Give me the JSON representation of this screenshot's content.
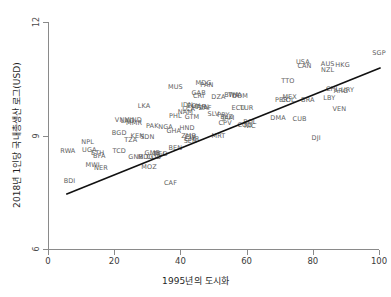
{
  "chart_data": {
    "type": "scatter",
    "title": "",
    "xlabel": "1995년의 도시화",
    "ylabel": "2018년 1인당 국내총생산 로그(USD)",
    "xlim": [
      0,
      100
    ],
    "ylim": [
      6,
      12
    ],
    "xticks": [
      0,
      20,
      40,
      60,
      80,
      100
    ],
    "yticks": [
      6,
      9,
      12
    ],
    "grid": false,
    "legend": "none",
    "marker_style": "text-labels",
    "label_color": "#5e5e5e",
    "trend_line": {
      "color": "#111111",
      "x_start": 5.5,
      "y_start": 7.45,
      "x_end": 100.5,
      "y_end": 10.79
    },
    "points": [
      {
        "label": "SGP",
        "x": 100.0,
        "y": 11.17
      },
      {
        "label": "HKG",
        "x": 89.0,
        "y": 10.87
      },
      {
        "label": "AUS",
        "x": 84.5,
        "y": 10.88
      },
      {
        "label": "USA",
        "x": 77.0,
        "y": 10.94
      },
      {
        "label": "CAN",
        "x": 77.5,
        "y": 10.84
      },
      {
        "label": "NZL",
        "x": 84.5,
        "y": 10.74
      },
      {
        "label": "TTO",
        "x": 72.5,
        "y": 10.44
      },
      {
        "label": "MDG",
        "x": 47.0,
        "y": 10.4
      },
      {
        "label": "PAN",
        "x": 48.0,
        "y": 10.34
      },
      {
        "label": "MUS",
        "x": 38.5,
        "y": 10.27
      },
      {
        "label": "CHL",
        "x": 86.0,
        "y": 10.24
      },
      {
        "label": "ARG",
        "x": 88.5,
        "y": 10.17
      },
      {
        "label": "URY",
        "x": 90.5,
        "y": 10.19
      },
      {
        "label": "GAB",
        "x": 45.5,
        "y": 10.13
      },
      {
        "label": "CRI",
        "x": 45.5,
        "y": 10.04
      },
      {
        "label": "DZA",
        "x": 51.5,
        "y": 10.03
      },
      {
        "label": "BWA",
        "x": 55.5,
        "y": 10.06
      },
      {
        "label": "THA",
        "x": 56.5,
        "y": 10.06
      },
      {
        "label": "DOM",
        "x": 58.0,
        "y": 10.04
      },
      {
        "label": "MEX",
        "x": 73.0,
        "y": 10.03
      },
      {
        "label": "LBY",
        "x": 85.0,
        "y": 9.99
      },
      {
        "label": "BRA",
        "x": 78.5,
        "y": 9.95
      },
      {
        "label": "COL",
        "x": 72.5,
        "y": 9.93
      },
      {
        "label": "PER",
        "x": 70.5,
        "y": 9.94
      },
      {
        "label": "LKA",
        "x": 29.0,
        "y": 9.78
      },
      {
        "label": "IDN",
        "x": 42.0,
        "y": 9.81
      },
      {
        "label": "EGY",
        "x": 44.0,
        "y": 9.78
      },
      {
        "label": "MAR",
        "x": 45.5,
        "y": 9.76
      },
      {
        "label": "TUN",
        "x": 46.5,
        "y": 9.76
      },
      {
        "label": "ZAF",
        "x": 47.5,
        "y": 9.74
      },
      {
        "label": "ECU",
        "x": 57.5,
        "y": 9.72
      },
      {
        "label": "TUR",
        "x": 60.0,
        "y": 9.72
      },
      {
        "label": "VEN",
        "x": 88.0,
        "y": 9.7
      },
      {
        "label": "LCA",
        "x": 42.5,
        "y": 9.7
      },
      {
        "label": "NAM",
        "x": 41.5,
        "y": 9.62
      },
      {
        "label": "SLV",
        "x": 50.0,
        "y": 9.56
      },
      {
        "label": "PRY",
        "x": 53.0,
        "y": 9.55
      },
      {
        "label": "GTM",
        "x": 43.5,
        "y": 9.48
      },
      {
        "label": "PHL",
        "x": 38.5,
        "y": 9.52
      },
      {
        "label": "BLZ",
        "x": 54.0,
        "y": 9.5
      },
      {
        "label": "JAM",
        "x": 54.5,
        "y": 9.46
      },
      {
        "label": "DMA",
        "x": 69.5,
        "y": 9.47
      },
      {
        "label": "CUB",
        "x": 76.0,
        "y": 9.44
      },
      {
        "label": "VNM",
        "x": 22.5,
        "y": 9.4
      },
      {
        "label": "LAO",
        "x": 24.0,
        "y": 9.38
      },
      {
        "label": "IND",
        "x": 26.5,
        "y": 9.4
      },
      {
        "label": "MMR",
        "x": 26.0,
        "y": 9.32
      },
      {
        "label": "BOL",
        "x": 61.0,
        "y": 9.35
      },
      {
        "label": "CPV",
        "x": 53.5,
        "y": 9.33
      },
      {
        "label": "COG",
        "x": 59.5,
        "y": 9.28
      },
      {
        "label": "NIC",
        "x": 61.0,
        "y": 9.24
      },
      {
        "label": "PAK",
        "x": 31.5,
        "y": 9.24
      },
      {
        "label": "NGA",
        "x": 35.5,
        "y": 9.22
      },
      {
        "label": "HND",
        "x": 42.0,
        "y": 9.2
      },
      {
        "label": "GHA",
        "x": 38.0,
        "y": 9.13
      },
      {
        "label": "BGD",
        "x": 21.5,
        "y": 9.06
      },
      {
        "label": "MRT",
        "x": 51.5,
        "y": 9.0
      },
      {
        "label": "ZMB",
        "x": 42.5,
        "y": 8.99
      },
      {
        "label": "CIV",
        "x": 43.0,
        "y": 8.97
      },
      {
        "label": "KEN",
        "x": 27.0,
        "y": 8.98
      },
      {
        "label": "CMR",
        "x": 43.5,
        "y": 8.9
      },
      {
        "label": "SEN",
        "x": 43.0,
        "y": 8.85
      },
      {
        "label": "SDN",
        "x": 30.0,
        "y": 8.96
      },
      {
        "label": "TZA",
        "x": 25.0,
        "y": 8.88
      },
      {
        "label": "NPL",
        "x": 12.0,
        "y": 8.82
      },
      {
        "label": "DJI",
        "x": 81.0,
        "y": 8.94
      },
      {
        "label": "BEN",
        "x": 38.5,
        "y": 8.66
      },
      {
        "label": "RWA",
        "x": 6.0,
        "y": 8.59
      },
      {
        "label": "UGA",
        "x": 12.5,
        "y": 8.61
      },
      {
        "label": "ETH",
        "x": 15.0,
        "y": 8.55
      },
      {
        "label": "TCD",
        "x": 21.5,
        "y": 8.6
      },
      {
        "label": "GMB",
        "x": 31.5,
        "y": 8.55
      },
      {
        "label": "MLI",
        "x": 33.5,
        "y": 8.52
      },
      {
        "label": "TGO",
        "x": 34.0,
        "y": 8.5
      },
      {
        "label": "BFA",
        "x": 15.5,
        "y": 8.46
      },
      {
        "label": "GNB",
        "x": 26.5,
        "y": 8.44
      },
      {
        "label": "MDG",
        "x": 29.5,
        "y": 8.42
      },
      {
        "label": "COD",
        "x": 32.0,
        "y": 8.42
      },
      {
        "label": "MWI",
        "x": 13.5,
        "y": 8.21
      },
      {
        "label": "NER",
        "x": 16.0,
        "y": 8.14
      },
      {
        "label": "MOZ",
        "x": 30.5,
        "y": 8.18
      },
      {
        "label": "BDI",
        "x": 6.5,
        "y": 7.8
      },
      {
        "label": "CAF",
        "x": 37.0,
        "y": 7.74
      }
    ]
  },
  "labels": {
    "y_ticks": [
      "12",
      "9",
      "6"
    ],
    "x_ticks": [
      "0",
      "20",
      "40",
      "60",
      "80",
      "100"
    ]
  }
}
